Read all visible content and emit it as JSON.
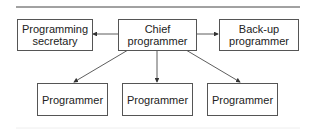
{
  "diagram": {
    "nodes": {
      "secretary": {
        "line1": "Programming",
        "line2": "secretary"
      },
      "chief": {
        "line1": "Chief",
        "line2": "programmer"
      },
      "backup": {
        "line1": "Back-up",
        "line2": "programmer"
      },
      "programmer1": {
        "label": "Programmer"
      },
      "programmer2": {
        "label": "Programmer"
      },
      "programmer3": {
        "label": "Programmer"
      }
    },
    "edges": [
      {
        "from": "chief",
        "to": "secretary"
      },
      {
        "from": "chief",
        "to": "backup"
      },
      {
        "from": "chief",
        "to": "programmer1"
      },
      {
        "from": "chief",
        "to": "programmer2"
      },
      {
        "from": "chief",
        "to": "programmer3"
      }
    ]
  }
}
